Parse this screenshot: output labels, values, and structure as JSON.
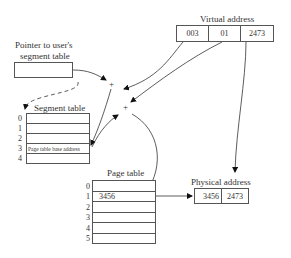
{
  "virtual_address": {
    "label": "Virtual address",
    "fields": [
      "003",
      "01",
      "2473"
    ]
  },
  "pointer": {
    "label_line1": "Pointer to user's",
    "label_line2": "segment table"
  },
  "segment_table": {
    "label": "Segment table",
    "indices": [
      "0",
      "1",
      "2",
      "3",
      "4"
    ],
    "entries": [
      "",
      "",
      "",
      "Page table base address",
      ""
    ]
  },
  "page_table": {
    "label": "Page table",
    "indices": [
      "0",
      "1",
      "2",
      "3",
      "4",
      "5"
    ],
    "entries": [
      "",
      "3456",
      "",
      "",
      "",
      ""
    ]
  },
  "physical_address": {
    "label": "Physical address",
    "fields": [
      "3456",
      "2473"
    ]
  },
  "adders": [
    "+",
    "+"
  ]
}
